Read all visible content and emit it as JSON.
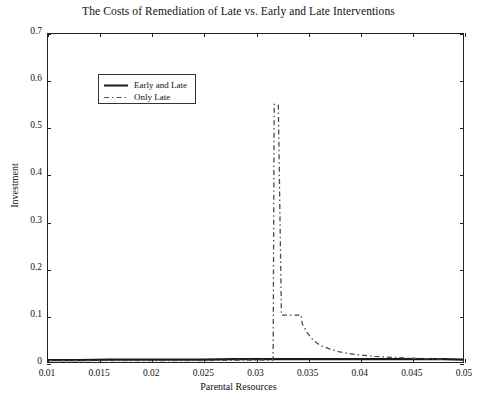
{
  "chart_data": {
    "type": "line",
    "title": "The Costs of Remediation of Late vs. Early and Late Interventions",
    "xlabel": "Parental Resources",
    "ylabel": "Investment",
    "xlim": [
      0.01,
      0.05
    ],
    "ylim": [
      0,
      0.7
    ],
    "xticks": [
      0.01,
      0.015,
      0.02,
      0.025,
      0.03,
      0.035,
      0.04,
      0.045,
      0.05
    ],
    "xticklabels": [
      "0.01",
      "0.015",
      "0.02",
      "0.025",
      "0.03",
      "0.035",
      "0.04",
      "0.045",
      "0.05"
    ],
    "yticks": [
      0,
      0.1,
      0.2,
      0.3,
      0.4,
      0.5,
      0.6,
      0.7
    ],
    "yticklabels": [
      "0",
      "0.1",
      "0.2",
      "0.3",
      "0.4",
      "0.5",
      "0.6",
      "0.7"
    ],
    "grid": false,
    "legend_position": "upper left",
    "series": [
      {
        "name": "Early and Late",
        "style": "solid",
        "color": "#1a1a1a",
        "x": [
          0.01,
          0.013,
          0.016,
          0.019,
          0.022,
          0.025,
          0.028,
          0.031,
          0.034,
          0.037,
          0.04,
          0.043,
          0.046,
          0.048,
          0.05
        ],
        "y": [
          0.004,
          0.004,
          0.005,
          0.005,
          0.005,
          0.005,
          0.006,
          0.006,
          0.006,
          0.006,
          0.006,
          0.006,
          0.006,
          0.006,
          0.005
        ]
      },
      {
        "name": "Only Late",
        "style": "dashed",
        "color": "#4a4a4a",
        "x": [
          0.01,
          0.015,
          0.02,
          0.025,
          0.029,
          0.031,
          0.0317,
          0.0318,
          0.0321,
          0.0322,
          0.0325,
          0.033,
          0.0338,
          0.0344,
          0.0345,
          0.035,
          0.0355,
          0.0362,
          0.037,
          0.038,
          0.039,
          0.04,
          0.0415,
          0.043,
          0.045,
          0.047,
          0.048
        ],
        "y": [
          0.003,
          0.003,
          0.003,
          0.003,
          0.004,
          0.004,
          0.004,
          0.55,
          0.55,
          0.548,
          0.1,
          0.1,
          0.1,
          0.1,
          0.082,
          0.062,
          0.048,
          0.036,
          0.029,
          0.022,
          0.018,
          0.015,
          0.012,
          0.01,
          0.008,
          0.007,
          0.006
        ]
      }
    ]
  },
  "legend": {
    "items": [
      {
        "label": "Early and Late"
      },
      {
        "label": "Only Late"
      }
    ]
  }
}
